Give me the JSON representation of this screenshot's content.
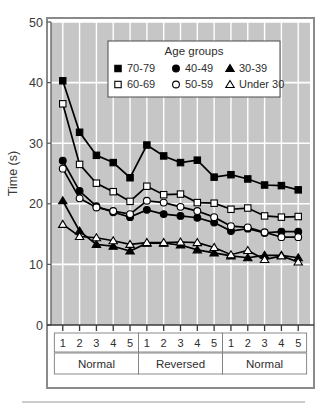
{
  "figure": {
    "background_color": "#ffffff",
    "plot_background_color": "#c6c6c6",
    "gridline_color": "#ffffff",
    "series_color": "#000000",
    "frame_color": "#8a8a8a",
    "bottom_rule_color": "#9a9a9a"
  },
  "chart_data": {
    "type": "line",
    "title": "",
    "subtitle": "",
    "xlabel": "",
    "ylabel": "Time (s)",
    "ylim": [
      0,
      50
    ],
    "yticks": [
      0,
      10,
      20,
      30,
      40,
      50
    ],
    "ytick_labels": [
      "0",
      "10",
      "20",
      "30",
      "40",
      "50"
    ],
    "grid": true,
    "grid_axis": "both",
    "legend_position": "upper-center-inside",
    "legend_title": "Age groups",
    "x": [
      1,
      2,
      3,
      4,
      5,
      6,
      7,
      8,
      9,
      10,
      11,
      12,
      13,
      14,
      15
    ],
    "categories": [
      "1",
      "2",
      "3",
      "4",
      "5",
      "1",
      "2",
      "3",
      "4",
      "5",
      "1",
      "2",
      "3",
      "4",
      "5"
    ],
    "x_group_bands": [
      {
        "label": "Normal",
        "start_index": 0,
        "end_index": 4
      },
      {
        "label": "Reversed",
        "start_index": 5,
        "end_index": 9
      },
      {
        "label": "Normal",
        "start_index": 10,
        "end_index": 14
      }
    ],
    "series": [
      {
        "name": "70-79",
        "marker": "filled-square",
        "marker_fill": "#000000",
        "values": [
          40.3,
          31.8,
          28.0,
          26.8,
          24.3,
          29.7,
          27.9,
          26.8,
          27.2,
          24.4,
          24.8,
          24.1,
          23.1,
          23.0,
          22.3
        ]
      },
      {
        "name": "60-69",
        "marker": "open-square",
        "marker_fill": "#ffffff",
        "values": [
          36.5,
          26.5,
          23.4,
          22.0,
          20.4,
          22.9,
          21.5,
          21.6,
          20.2,
          20.1,
          19.1,
          19.3,
          18.0,
          17.8,
          17.9
        ]
      },
      {
        "name": "40-49",
        "marker": "filled-circle",
        "marker_fill": "#000000",
        "values": [
          27.1,
          22.1,
          19.6,
          18.6,
          17.8,
          19.0,
          18.3,
          18.0,
          17.7,
          16.9,
          15.5,
          15.9,
          15.2,
          15.4,
          15.4
        ]
      },
      {
        "name": "50-59",
        "marker": "open-circle",
        "marker_fill": "#ffffff",
        "values": [
          25.8,
          20.9,
          19.4,
          18.8,
          18.3,
          20.5,
          20.2,
          19.5,
          18.8,
          17.8,
          16.3,
          16.1,
          15.3,
          14.5,
          14.5
        ]
      },
      {
        "name": "30-39",
        "marker": "filled-triangle",
        "marker_fill": "#000000",
        "values": [
          20.5,
          15.5,
          13.3,
          13.0,
          12.2,
          13.5,
          13.5,
          13.2,
          12.4,
          11.9,
          11.4,
          11.1,
          11.5,
          11.5,
          11.1
        ]
      },
      {
        "name": "Under 30",
        "marker": "open-triangle",
        "marker_fill": "#ffffff",
        "values": [
          16.6,
          14.6,
          14.4,
          13.9,
          13.3,
          13.6,
          13.6,
          13.7,
          13.6,
          12.8,
          11.6,
          12.3,
          10.8,
          11.4,
          10.4
        ]
      }
    ],
    "legend_entries": [
      {
        "label": "70-79",
        "marker": "filled-square"
      },
      {
        "label": "40-49",
        "marker": "filled-circle"
      },
      {
        "label": "30-39",
        "marker": "filled-triangle"
      },
      {
        "label": "60-69",
        "marker": "open-square"
      },
      {
        "label": "50-59",
        "marker": "open-circle"
      },
      {
        "label": "Under 30",
        "marker": "open-triangle"
      }
    ]
  }
}
